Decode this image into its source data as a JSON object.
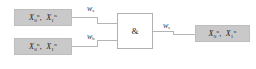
{
  "diagram": {
    "type": "logic-gate-diagram",
    "background_color": "#ffffff",
    "node_fill_color": "#c9c9c9",
    "gate_fill_color": "#ffffff",
    "edge_color": "#b5b5b5",
    "text_color": "#1c1c1c"
  },
  "nodes": {
    "input_a": {
      "name": "input-a",
      "terms": [
        {
          "base": "X",
          "sub": "0",
          "sup": "n"
        },
        {
          "base": "X",
          "sub": "1",
          "sup": "n"
        }
      ],
      "separator": ","
    },
    "input_b": {
      "name": "input-b",
      "terms": [
        {
          "base": "X",
          "sub": "0",
          "sup": "n"
        },
        {
          "base": "X",
          "sub": "1",
          "sup": "n"
        }
      ],
      "separator": ","
    },
    "output": {
      "name": "output",
      "terms": [
        {
          "base": "X",
          "sub": "0",
          "sup": "n"
        },
        {
          "base": "X",
          "sub": "1",
          "sup": "n"
        }
      ],
      "separator": ","
    }
  },
  "gate": {
    "symbol": "&",
    "label": "and-gate"
  },
  "edges": {
    "wa": {
      "base": "w",
      "sub": "a"
    },
    "wb": {
      "base": "w",
      "sub": "b"
    },
    "wc": {
      "base": "w",
      "sub": "c"
    }
  }
}
